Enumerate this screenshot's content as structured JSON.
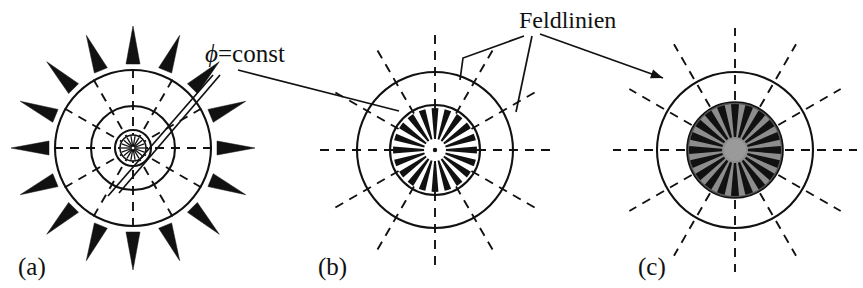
{
  "figure": {
    "kind": "physics-diagram",
    "background_color": "#ffffff",
    "ink_color": "#111111",
    "gray_color": "#8d8d8d",
    "dark_fill_color": "#1a1a1a"
  },
  "annotations": {
    "phi_const": {
      "label": "ϕ=const",
      "symbol": "ϕ",
      "equals_rest": "=const",
      "x": 205,
      "y": 62
    },
    "feldlinien": {
      "label": "Feldlinien",
      "x": 519,
      "y": 28
    }
  },
  "panels": [
    {
      "id": "a",
      "label": "(a)",
      "label_x": 18,
      "label_y": 275,
      "center": {
        "x": 133,
        "y": 148
      },
      "circles": [
        {
          "name": "outer-equipotential",
          "r": 78,
          "style": "solid"
        },
        {
          "name": "middle-equipotential",
          "r": 42,
          "style": "solid"
        },
        {
          "name": "inner-equipotential",
          "r": 18,
          "style": "solid"
        }
      ],
      "dashed_radial_lines": 12,
      "dashed_inner_r": 6,
      "dashed_outer_r": 86,
      "arrows": {
        "count": 16,
        "inner_r": 84,
        "outer_r": 122,
        "half_width": 7,
        "fill": "#111111"
      },
      "hub": {
        "r": 13,
        "spokes": 18,
        "fill": "#ffffff"
      }
    },
    {
      "id": "b",
      "label": "(b)",
      "label_x": 318,
      "label_y": 275,
      "center": {
        "x": 435,
        "y": 150
      },
      "circles": [
        {
          "name": "outer-equipotential",
          "r": 78,
          "style": "solid"
        },
        {
          "name": "inner-boundary",
          "r": 45,
          "style": "solid"
        }
      ],
      "dashed_radial_lines": 12,
      "dashed_inner_r": 10,
      "dashed_outer_r": 120,
      "wedge_disk": {
        "name": "field-wedges",
        "count": 20,
        "inner_r": 11,
        "outer_r": 42,
        "fill": "#111111",
        "background": "#ffffff",
        "angular_fraction": 0.52
      },
      "hub": {
        "r": 7,
        "fill": "#ffffff",
        "dot_r": 2.2,
        "dot_fill": "#111111"
      }
    },
    {
      "id": "c",
      "label": "(c)",
      "label_x": 638,
      "label_y": 275,
      "center": {
        "x": 735,
        "y": 150
      },
      "circles": [
        {
          "name": "outer-equipotential",
          "r": 78,
          "style": "solid"
        }
      ],
      "dashed_radial_lines": 12,
      "dashed_inner_r": 50,
      "dashed_outer_r": 122,
      "wedge_disk": {
        "name": "shielded-core",
        "count": 20,
        "inner_r": 13,
        "outer_r": 46,
        "fill": "#111111",
        "background": "#8d8d8d",
        "angular_fraction": 0.56,
        "rim_r": 48,
        "rim_fill": "#555555"
      },
      "hub": {
        "r": 11,
        "fill": "#9a9a9a"
      }
    }
  ],
  "leader_lines": {
    "phi_const": [
      {
        "name": "phi-leader-to-outer-circle",
        "x1": 213,
        "y1": 75,
        "x2": 108,
        "y2": 196
      },
      {
        "name": "phi-leader-to-middle-circle",
        "x1": 220,
        "y1": 75,
        "x2": 119,
        "y2": 193
      },
      {
        "name": "phi-leader-to-panel-b",
        "x1": 238,
        "y1": 70,
        "x2": 399,
        "y2": 111
      }
    ],
    "feldlinien": [
      {
        "name": "feld-leader-left",
        "x1": 524,
        "y1": 36,
        "x2": 463,
        "y2": 58,
        "elbow_x": 460,
        "elbow_y": 80
      },
      {
        "name": "feld-leader-middle",
        "x1": 532,
        "y1": 36,
        "x2": 516,
        "y2": 112
      },
      {
        "name": "feld-leader-right-to-c",
        "x1": 540,
        "y1": 34,
        "x2": 663,
        "y2": 78,
        "arrowhead": true
      }
    ]
  }
}
